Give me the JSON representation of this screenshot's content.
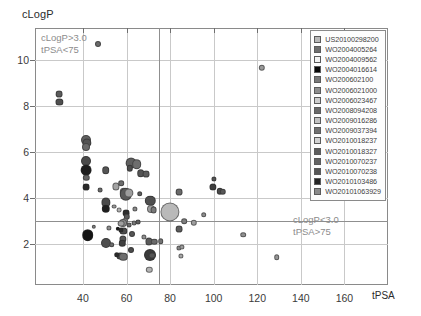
{
  "chart_data": {
    "type": "scatter",
    "title": "",
    "xlabel": "tPSA",
    "ylabel": "cLogP",
    "xlim": [
      18,
      180
    ],
    "ylim": [
      0.2,
      11.4
    ],
    "xticks": [
      40,
      60,
      80,
      100,
      120,
      140,
      160
    ],
    "yticks": [
      2,
      4,
      6,
      8,
      10
    ],
    "grid": true,
    "legend_position": "top-right",
    "annotations": [
      {
        "id": "upper-left-quadrant",
        "text": "cLogP>3.0\ntPSA<75"
      },
      {
        "id": "lower-right-quadrant",
        "text": "cLogP<3.0\ntPSA>75"
      }
    ],
    "quadrant_lines": {
      "x": 75,
      "y": 3.0
    },
    "bubble_note": "marker area encodes a third variable; greyscale encodes patent series",
    "points": [
      {
        "x": 29.2,
        "y": 8.52,
        "r": 3.4,
        "c": "#5b5b5b"
      },
      {
        "x": 29.2,
        "y": 8.18,
        "r": 3.6,
        "c": "#4f4f4f"
      },
      {
        "x": 47.0,
        "y": 10.72,
        "r": 3.0,
        "c": "#6b6b6b"
      },
      {
        "x": 122.0,
        "y": 9.66,
        "r": 3.2,
        "c": "#9a9a9a"
      },
      {
        "x": 155.5,
        "y": 5.86,
        "r": 3.2,
        "c": "#3a3a3a"
      },
      {
        "x": 41.6,
        "y": 6.52,
        "r": 5.0,
        "c": "#5f5f5f"
      },
      {
        "x": 42.0,
        "y": 6.38,
        "r": 4.6,
        "c": "#535353"
      },
      {
        "x": 41.6,
        "y": 6.22,
        "r": 4.0,
        "c": "#6a6a6a"
      },
      {
        "x": 41.4,
        "y": 5.62,
        "r": 5.0,
        "c": "#4a4a4a"
      },
      {
        "x": 41.4,
        "y": 5.22,
        "r": 5.4,
        "c": "#1c1c1c"
      },
      {
        "x": 41.6,
        "y": 4.86,
        "r": 3.2,
        "c": "#636363"
      },
      {
        "x": 41.6,
        "y": 4.46,
        "r": 3.4,
        "c": "#2a2a2a"
      },
      {
        "x": 50.5,
        "y": 5.2,
        "r": 3.8,
        "c": "#555555"
      },
      {
        "x": 50.6,
        "y": 3.8,
        "r": 4.6,
        "c": "#4a4a4a"
      },
      {
        "x": 50.4,
        "y": 3.52,
        "r": 4.2,
        "c": "#1e1e1e"
      },
      {
        "x": 50.6,
        "y": 2.04,
        "r": 5.0,
        "c": "#4e4e4e"
      },
      {
        "x": 42.2,
        "y": 2.36,
        "r": 5.8,
        "c": "#141414"
      },
      {
        "x": 55.0,
        "y": 4.5,
        "r": 3.6,
        "c": "#a3a3a3"
      },
      {
        "x": 57.5,
        "y": 4.64,
        "r": 2.8,
        "c": "#6d6d6d"
      },
      {
        "x": 58.8,
        "y": 4.24,
        "r": 4.2,
        "c": "#8d8d8d"
      },
      {
        "x": 59.6,
        "y": 4.16,
        "r": 6.2,
        "c": "#5a5a5a"
      },
      {
        "x": 61.0,
        "y": 4.22,
        "r": 4.6,
        "c": "#9c9c9c"
      },
      {
        "x": 62.0,
        "y": 5.52,
        "r": 5.4,
        "c": "#606060"
      },
      {
        "x": 64.6,
        "y": 5.46,
        "r": 4.8,
        "c": "#6e6e6e"
      },
      {
        "x": 61.6,
        "y": 5.28,
        "r": 3.2,
        "c": "#4d4d4d"
      },
      {
        "x": 66.0,
        "y": 4.18,
        "r": 2.8,
        "c": "#5e5e5e"
      },
      {
        "x": 59.8,
        "y": 3.34,
        "r": 3.4,
        "c": "#2e2e2e"
      },
      {
        "x": 60.0,
        "y": 3.18,
        "r": 3.2,
        "c": "#5a5a5a"
      },
      {
        "x": 59.2,
        "y": 3.0,
        "r": 3.0,
        "c": "#8e8e8e"
      },
      {
        "x": 58.2,
        "y": 2.92,
        "r": 4.0,
        "c": "#8a8a8a"
      },
      {
        "x": 57.4,
        "y": 2.88,
        "r": 3.4,
        "c": "#a0a0a0"
      },
      {
        "x": 58.6,
        "y": 2.56,
        "r": 3.6,
        "c": "#4c4c4c"
      },
      {
        "x": 57.6,
        "y": 2.6,
        "r": 2.6,
        "c": "#2d2d2d"
      },
      {
        "x": 58.2,
        "y": 2.2,
        "r": 3.6,
        "c": "#555555"
      },
      {
        "x": 58.0,
        "y": 2.02,
        "r": 3.2,
        "c": "#3f3f3f"
      },
      {
        "x": 57.2,
        "y": 1.46,
        "r": 3.6,
        "c": "#464646"
      },
      {
        "x": 58.6,
        "y": 1.44,
        "r": 4.2,
        "c": "#6e6e6e"
      },
      {
        "x": 55.4,
        "y": 1.52,
        "r": 2.8,
        "c": "#2a2a2a"
      },
      {
        "x": 62.0,
        "y": 1.72,
        "r": 3.0,
        "c": "#4b4b4b"
      },
      {
        "x": 62.6,
        "y": 2.44,
        "r": 3.0,
        "c": "#555555"
      },
      {
        "x": 56.0,
        "y": 2.64,
        "r": 2.2,
        "c": "#1a1a1a"
      },
      {
        "x": 71.0,
        "y": 3.88,
        "r": 5.2,
        "c": "#4f4f4f"
      },
      {
        "x": 71.2,
        "y": 3.52,
        "r": 4.0,
        "c": "#9e9e9e"
      },
      {
        "x": 72.4,
        "y": 3.46,
        "r": 3.4,
        "c": "#787878"
      },
      {
        "x": 70.4,
        "y": 2.1,
        "r": 3.6,
        "c": "#5a5a5a"
      },
      {
        "x": 72.8,
        "y": 2.08,
        "r": 3.2,
        "c": "#6a6a6a"
      },
      {
        "x": 70.8,
        "y": 1.52,
        "r": 6.0,
        "c": "#3a3a3a"
      },
      {
        "x": 71.8,
        "y": 1.48,
        "r": 3.4,
        "c": "#555555"
      },
      {
        "x": 70.4,
        "y": 0.86,
        "r": 3.2,
        "c": "#b4b4b4"
      },
      {
        "x": 66.6,
        "y": 5.06,
        "r": 3.8,
        "c": "#545454"
      },
      {
        "x": 69.0,
        "y": 5.02,
        "r": 3.4,
        "c": "#5c5c5c"
      },
      {
        "x": 75.6,
        "y": 2.1,
        "r": 2.8,
        "c": "#737373"
      },
      {
        "x": 80.0,
        "y": 3.38,
        "r": 9.6,
        "c": "#b9b9b9"
      },
      {
        "x": 84.0,
        "y": 4.24,
        "r": 3.4,
        "c": "#6a6a6a"
      },
      {
        "x": 84.2,
        "y": 2.62,
        "r": 3.4,
        "c": "#5c5c5c"
      },
      {
        "x": 84.0,
        "y": 1.82,
        "r": 2.6,
        "c": "#8a8a8a"
      },
      {
        "x": 85.4,
        "y": 1.86,
        "r": 2.6,
        "c": "#9b9b9b"
      },
      {
        "x": 84.8,
        "y": 1.48,
        "r": 2.6,
        "c": "#a6a6a6"
      },
      {
        "x": 86.6,
        "y": 2.98,
        "r": 2.8,
        "c": "#7d7d7d"
      },
      {
        "x": 91.0,
        "y": 2.92,
        "r": 3.2,
        "c": "#9e9e9e"
      },
      {
        "x": 95.4,
        "y": 3.26,
        "r": 2.8,
        "c": "#8d8d8d"
      },
      {
        "x": 100.0,
        "y": 4.84,
        "r": 2.6,
        "c": "#545454"
      },
      {
        "x": 99.8,
        "y": 4.48,
        "r": 3.6,
        "c": "#3d3d3d"
      },
      {
        "x": 102.8,
        "y": 4.28,
        "r": 3.2,
        "c": "#4a4a4a"
      },
      {
        "x": 104.2,
        "y": 4.26,
        "r": 3.2,
        "c": "#585858"
      },
      {
        "x": 113.6,
        "y": 2.4,
        "r": 2.8,
        "c": "#8f8f8f"
      },
      {
        "x": 129.0,
        "y": 1.42,
        "r": 2.8,
        "c": "#959595"
      },
      {
        "x": 173.0,
        "y": 4.08,
        "r": 3.0,
        "c": "#7a7a7a"
      },
      {
        "x": 52.0,
        "y": 2.7,
        "r": 2.6,
        "c": "#8f8f8f"
      },
      {
        "x": 53.2,
        "y": 1.96,
        "r": 2.8,
        "c": "#6c6c6c"
      },
      {
        "x": 63.4,
        "y": 2.9,
        "r": 2.4,
        "c": "#777777"
      },
      {
        "x": 61.2,
        "y": 2.82,
        "r": 2.4,
        "c": "#6a6a6a"
      },
      {
        "x": 64.0,
        "y": 3.52,
        "r": 2.6,
        "c": "#8a8a8a"
      },
      {
        "x": 65.4,
        "y": 2.94,
        "r": 2.4,
        "c": "#5f5f5f"
      },
      {
        "x": 67.8,
        "y": 2.28,
        "r": 2.6,
        "c": "#909090"
      },
      {
        "x": 56.6,
        "y": 3.46,
        "r": 2.4,
        "c": "#b0b0b0"
      },
      {
        "x": 54.2,
        "y": 3.62,
        "r": 2.4,
        "c": "#999999"
      },
      {
        "x": 47.8,
        "y": 4.34,
        "r": 2.4,
        "c": "#6b6b6b"
      },
      {
        "x": 45.0,
        "y": 2.74,
        "r": 2.2,
        "c": "#7f7f7f"
      }
    ]
  },
  "axes": {
    "y_title": "cLogP",
    "x_title": "tPSA",
    "y_tick_labels": [
      "2",
      "4",
      "6",
      "8",
      "10"
    ],
    "x_tick_labels": [
      "40",
      "60",
      "80",
      "100",
      "120",
      "140",
      "160"
    ]
  },
  "annotations": {
    "top_left": "cLogP>3.0\ntPSA<75",
    "bottom_right": "cLogP<3.0\ntPSA>75"
  },
  "legend": {
    "items": [
      {
        "label": "US20100298200",
        "color": "#b8b8b8"
      },
      {
        "label": "WO2004005264",
        "color": "#6e6e6e"
      },
      {
        "label": "WO2004009562",
        "color": "#f2f2f2"
      },
      {
        "label": "WO2004016614",
        "color": "#070707"
      },
      {
        "label": "WO200602100",
        "color": "#787878"
      },
      {
        "label": "WO2006021000",
        "color": "#8e8e8e"
      },
      {
        "label": "WO2006023467",
        "color": "#cdcdcd"
      },
      {
        "label": "WO2008094208",
        "color": "#6a6a6a"
      },
      {
        "label": "WO2009016286",
        "color": "#c2c2c2"
      },
      {
        "label": "WO2009037394",
        "color": "#717171"
      },
      {
        "label": "WO2010018237",
        "color": "#d3d3d3"
      },
      {
        "label": "WO2010018327",
        "color": "#5d5d5d"
      },
      {
        "label": "WO2010070237",
        "color": "#636363"
      },
      {
        "label": "WO2010070238",
        "color": "#555555"
      },
      {
        "label": "WO2010103486",
        "color": "#242424"
      },
      {
        "label": "WO20101063929",
        "color": "#8a8a8a"
      }
    ]
  }
}
